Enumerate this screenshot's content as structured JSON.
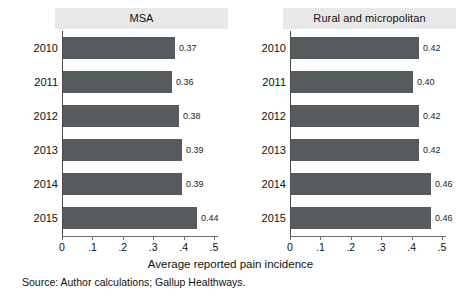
{
  "chart_data": {
    "type": "bar",
    "title": "",
    "xlabel": "Average reported pain incidence",
    "ylabel": "",
    "orientation": "horizontal",
    "xlim": [
      0,
      0.5
    ],
    "xticks": [
      "0",
      ".1",
      ".2",
      ".3",
      ".4",
      ".5"
    ],
    "xtick_values": [
      0,
      0.1,
      0.2,
      0.3,
      0.4,
      0.5
    ],
    "grid": false,
    "legend": "none",
    "categories": [
      "2010",
      "2011",
      "2012",
      "2013",
      "2014",
      "2015"
    ],
    "bar_color": "#565b5d",
    "panels": [
      {
        "title": "MSA",
        "values": [
          0.37,
          0.36,
          0.38,
          0.39,
          0.39,
          0.44
        ],
        "labels": [
          "0.37",
          "0.36",
          "0.38",
          "0.39",
          "0.39",
          "0.44"
        ]
      },
      {
        "title": "Rural and micropolitan",
        "values": [
          0.42,
          0.4,
          0.42,
          0.42,
          0.46,
          0.46
        ],
        "labels": [
          "0.42",
          "0.40",
          "0.42",
          "0.42",
          "0.46",
          "0.46"
        ]
      }
    ],
    "source": "Source: Author calculations; Gallup Healthways."
  },
  "figure": {
    "axis_title": "Average reported pain incidence",
    "source_note": "Source: Author calculations; Gallup Healthways."
  }
}
